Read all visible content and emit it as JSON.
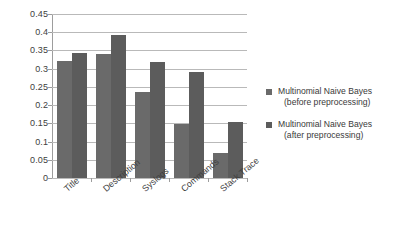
{
  "chart_data": {
    "type": "bar",
    "title": "",
    "subtitle": "",
    "xlabel": "",
    "ylabel": "",
    "categories": [
      "Title",
      "Description",
      "Syslogs",
      "Commands",
      "Stack Trace"
    ],
    "series": [
      {
        "name": "Multinomial Naive Bayes (before preprocessing)",
        "name_line1": "Multinomial Naive Bayes",
        "name_line2": "(before preprocessing)",
        "color": "#6a6a6a",
        "values": [
          0.32,
          0.34,
          0.237,
          0.147,
          0.068
        ]
      },
      {
        "name": "Multinomial Naive Bayes (after preprocessing)",
        "name_line1": "Multinomial Naive Bayes",
        "name_line2": "(after preprocessing)",
        "color": "#5c5c5c",
        "values": [
          0.342,
          0.392,
          0.318,
          0.29,
          0.153
        ]
      }
    ],
    "ylim": [
      0,
      0.45
    ],
    "y_ticks": [
      "0.45",
      "0.4",
      "0.35",
      "0.3",
      "0.25",
      "0.2",
      "0.15",
      "0.1",
      "0.05",
      "0"
    ],
    "y_tick_values": [
      0.45,
      0.4,
      0.35,
      0.3,
      0.25,
      0.2,
      0.15,
      0.1,
      0.05,
      0
    ],
    "grid": true,
    "grid_axis": "y",
    "legend_position": "right",
    "x_tick_label_rotation": -40
  }
}
